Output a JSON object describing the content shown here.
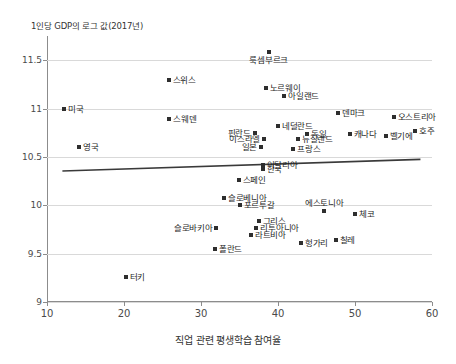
{
  "chart_data": {
    "type": "scatter",
    "title": "",
    "ylabel": "1인당 GDP의 로그 값(2017년)",
    "xlabel": "직업 관련 평생학습 참여율",
    "xlim": [
      10,
      60
    ],
    "ylim": [
      9,
      11.75
    ],
    "xticks": [
      10,
      20,
      30,
      40,
      50,
      60
    ],
    "yticks": [
      9,
      9.5,
      10,
      10.5,
      11,
      11.5
    ],
    "grid": "horizontal",
    "legend": "none",
    "marker_color": "#2e2e2e",
    "grid_color": "#d9d9d9",
    "axis_color": "#8c8c8c",
    "trendline": {
      "x": [
        12.0,
        58.5
      ],
      "y": [
        10.355,
        10.475
      ],
      "color": "#3a3a3a"
    },
    "points": [
      {
        "label": "룩셈부르크",
        "x": 38.8,
        "y": 11.58,
        "pos": "b"
      },
      {
        "label": "스위스",
        "x": 25.8,
        "y": 11.29,
        "pos": "r"
      },
      {
        "label": "노르웨이",
        "x": 38.4,
        "y": 11.21,
        "pos": "r"
      },
      {
        "label": "아일랜드",
        "x": 40.8,
        "y": 11.13,
        "pos": "r"
      },
      {
        "label": "미국",
        "x": 12.2,
        "y": 11.0,
        "pos": "r"
      },
      {
        "label": "덴마크",
        "x": 47.8,
        "y": 10.95,
        "pos": "r"
      },
      {
        "label": "오스트리아",
        "x": 55.0,
        "y": 10.91,
        "pos": "r"
      },
      {
        "label": "스웨덴",
        "x": 25.9,
        "y": 10.89,
        "pos": "r"
      },
      {
        "label": "네덜란드",
        "x": 40.0,
        "y": 10.82,
        "pos": "r"
      },
      {
        "label": "호주",
        "x": 57.8,
        "y": 10.77,
        "pos": "r"
      },
      {
        "label": "핀란드",
        "x": 37.0,
        "y": 10.75,
        "pos": "l"
      },
      {
        "label": "독일",
        "x": 43.8,
        "y": 10.74,
        "pos": "r"
      },
      {
        "label": "캐나다",
        "x": 49.3,
        "y": 10.74,
        "pos": "r"
      },
      {
        "label": "벨기에",
        "x": 54.0,
        "y": 10.72,
        "pos": "r"
      },
      {
        "label": "이스라엘",
        "x": 38.2,
        "y": 10.68,
        "pos": "l"
      },
      {
        "label": "뉴질랜드",
        "x": 42.6,
        "y": 10.68,
        "pos": "r"
      },
      {
        "label": "일본",
        "x": 37.8,
        "y": 10.6,
        "pos": "l"
      },
      {
        "label": "영국",
        "x": 14.2,
        "y": 10.6,
        "pos": "r"
      },
      {
        "label": "프랑스",
        "x": 42.0,
        "y": 10.58,
        "pos": "r"
      },
      {
        "label": "이탈리아",
        "x": 38.0,
        "y": 10.42,
        "pos": "r"
      },
      {
        "label": "한국",
        "x": 38.0,
        "y": 10.37,
        "pos": "r"
      },
      {
        "label": "스페인",
        "x": 34.9,
        "y": 10.26,
        "pos": "r"
      },
      {
        "label": "슬로베니아",
        "x": 33.0,
        "y": 10.08,
        "pos": "r"
      },
      {
        "label": "포르투갈",
        "x": 35.0,
        "y": 10.0,
        "pos": "r"
      },
      {
        "label": "에스토니아",
        "x": 46.0,
        "y": 9.94,
        "pos": "t"
      },
      {
        "label": "체코",
        "x": 50.0,
        "y": 9.91,
        "pos": "r"
      },
      {
        "label": "그리스",
        "x": 37.5,
        "y": 9.84,
        "pos": "r"
      },
      {
        "label": "리투아니아",
        "x": 37.2,
        "y": 9.77,
        "pos": "r"
      },
      {
        "label": "슬로바키아",
        "x": 32.0,
        "y": 9.77,
        "pos": "l"
      },
      {
        "label": "라트비아",
        "x": 36.5,
        "y": 9.69,
        "pos": "r"
      },
      {
        "label": "칠레",
        "x": 47.5,
        "y": 9.64,
        "pos": "r"
      },
      {
        "label": "헝가리",
        "x": 43.0,
        "y": 9.61,
        "pos": "r"
      },
      {
        "label": "폴란드",
        "x": 31.8,
        "y": 9.55,
        "pos": "r"
      },
      {
        "label": "터키",
        "x": 20.2,
        "y": 9.26,
        "pos": "r"
      }
    ]
  }
}
